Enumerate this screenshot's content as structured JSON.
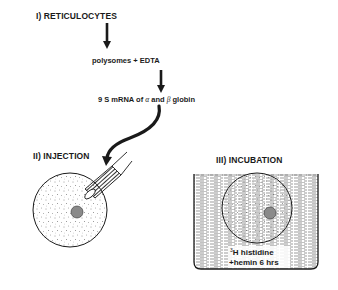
{
  "diagram": {
    "steps": {
      "step1": "I) RETICULOCYTES",
      "step2": "II) INJECTION",
      "step3": "III) INCUBATION"
    },
    "intermediate": {
      "polysomes": "polysomes + EDTA",
      "mrna_prefix": "9 S mRNA of ",
      "alpha": "α",
      "and": " and ",
      "beta": "β",
      "globin": " globin"
    },
    "incubation_label": {
      "isotope_mass": "3",
      "line1": "H histidine",
      "line2": "+hemin 6 hrs"
    },
    "colors": {
      "ink": "#1a1a1a",
      "nucleus": "#8a8a8a",
      "background": "#ffffff"
    }
  }
}
